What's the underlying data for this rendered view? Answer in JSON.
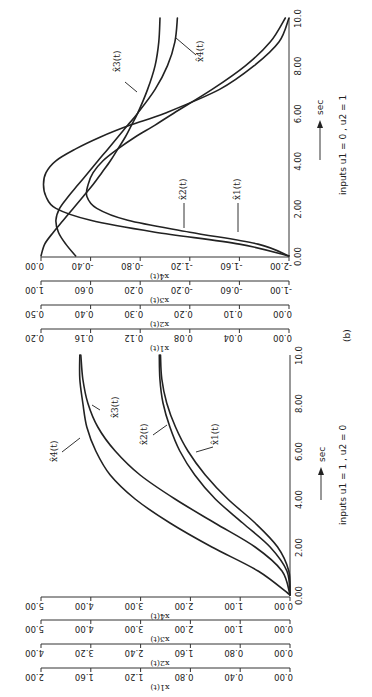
{
  "figure": {
    "panel_b_caption": "(b)",
    "rotation": "rotated 90° counter-clockwise on page"
  },
  "chart_data": [
    {
      "type": "line",
      "panel": "(a)",
      "title": "inputs u1 = 1 , u2 = 0",
      "xlabel": "sec",
      "x_ticks": [
        "0.00",
        "2.00",
        "4.00",
        "6.00",
        "8.00",
        "10.0"
      ],
      "xlim": [
        0,
        10
      ],
      "y_axes": [
        {
          "name": "x4(t)",
          "ticks": [
            "0.00",
            "1.00",
            "2.00",
            "3.00",
            "4.00",
            "5.00"
          ],
          "ylim": [
            0,
            5
          ]
        },
        {
          "name": "x3(t)",
          "ticks": [
            "0.00",
            "1.00",
            "2.00",
            "3.00",
            "4.00",
            "5.00"
          ],
          "ylim": [
            0,
            5
          ]
        },
        {
          "name": "x2(t)",
          "ticks": [
            "0.00",
            "0.80",
            "1.60",
            "2.40",
            "3.20",
            "4.00"
          ],
          "ylim": [
            0,
            4
          ]
        },
        {
          "name": "x1(t)",
          "ticks": [
            "0.00",
            "0.40",
            "0.80",
            "1.20",
            "1.60",
            "2.00"
          ],
          "ylim": [
            0,
            2
          ]
        }
      ],
      "x": [
        0,
        1,
        2,
        3,
        4,
        5,
        6,
        7,
        8,
        9,
        10
      ],
      "series": [
        {
          "name": "x̂4(t)",
          "axis": 0,
          "values": [
            0,
            0.64,
            1.57,
            2.41,
            3.11,
            3.61,
            3.9,
            4.08,
            4.16,
            4.22,
            4.22
          ]
        },
        {
          "name": "x̂3(t)",
          "axis": 1,
          "values": [
            0,
            0.16,
            0.7,
            1.51,
            2.31,
            3.01,
            3.51,
            3.86,
            4.06,
            4.16,
            4.2
          ]
        },
        {
          "name": "x̂2(t)",
          "axis": 2,
          "values": [
            0,
            0.05,
            0.32,
            0.76,
            1.2,
            1.53,
            1.77,
            1.93,
            2.04,
            2.09,
            2.1
          ]
        },
        {
          "name": "x̂1(t)",
          "axis": 3,
          "values": [
            0,
            0.01,
            0.1,
            0.28,
            0.5,
            0.68,
            0.82,
            0.92,
            0.99,
            1.03,
            1.04
          ]
        }
      ]
    },
    {
      "type": "line",
      "panel": "(b)",
      "title": "inputs u1 = 0 , u2 = 1",
      "xlabel": "sec",
      "x_ticks": [
        "0.00",
        "2.00",
        "4.00",
        "6.00",
        "8.00",
        "10.0"
      ],
      "xlim": [
        0,
        10
      ],
      "y_axes": [
        {
          "name": "x4(t)",
          "ticks": [
            "-2.00",
            "-1.60",
            "-1.20",
            "-0.80",
            "-0.40",
            "0.00"
          ],
          "ylim": [
            -2,
            0
          ]
        },
        {
          "name": "x3(t)",
          "ticks": [
            "-1.00",
            "-0.60",
            "-0.20",
            "0.20",
            "0.60",
            "1.00"
          ],
          "ylim": [
            -1,
            1
          ]
        },
        {
          "name": "x2(t)",
          "ticks": [
            "0.00",
            "0.10",
            "0.20",
            "0.30",
            "0.40",
            "0.50"
          ],
          "ylim": [
            0,
            0.5
          ]
        },
        {
          "name": "x1(t)",
          "ticks": [
            "0.00",
            "0.04",
            "0.08",
            "0.12",
            "0.16",
            "0.20"
          ],
          "ylim": [
            0,
            0.2
          ]
        }
      ],
      "x": [
        0,
        0.5,
        1,
        1.5,
        2,
        2.5,
        3,
        3.5,
        4,
        4.5,
        5,
        5.5,
        6,
        7,
        8,
        9,
        10
      ],
      "series": [
        {
          "name": "x̂3(t)",
          "axis": 1,
          "values": [
            1.0,
            0.97,
            0.9,
            0.82,
            0.74,
            0.66,
            0.58,
            0.51,
            0.44,
            0.38,
            0.32,
            0.27,
            0.22,
            0.14,
            0.08,
            0.05,
            0.04
          ]
        },
        {
          "name": "x̂4(t)",
          "axis": 0,
          "values": [
            -0.28,
            -0.2,
            -0.14,
            -0.12,
            -0.15,
            -0.22,
            -0.3,
            -0.38,
            -0.46,
            -0.54,
            -0.62,
            -0.7,
            -0.78,
            -0.92,
            -1.02,
            -1.08,
            -1.1
          ]
        },
        {
          "name": "x̂2(t)",
          "axis": 2,
          "values": [
            0.0,
            0.1,
            0.27,
            0.4,
            0.47,
            0.49,
            0.495,
            0.49,
            0.47,
            0.43,
            0.38,
            0.32,
            0.25,
            0.14,
            0.07,
            0.02,
            0.0
          ]
        },
        {
          "name": "x̂1(t)",
          "axis": 3,
          "values": [
            0.0,
            0.025,
            0.08,
            0.13,
            0.155,
            0.163,
            0.162,
            0.158,
            0.15,
            0.138,
            0.124,
            0.108,
            0.093,
            0.062,
            0.035,
            0.015,
            0.003
          ]
        }
      ]
    }
  ],
  "labels": {
    "a_x4": "x̂4(t)",
    "a_x3": "x̂3(t)",
    "a_x2": "x̂2(t)",
    "a_x1": "x̂1(t)",
    "b_x3": "x̂3(t)",
    "b_x4": "x̂4(t)",
    "b_x2": "x̂2(t)",
    "b_x1": "x̂1(t)",
    "sec": "sec",
    "a_inputs": "inputs u1 = 1 , u2 = 0",
    "b_inputs": "inputs u1 = 0 , u2 = 1",
    "panel_b": "(b)"
  }
}
